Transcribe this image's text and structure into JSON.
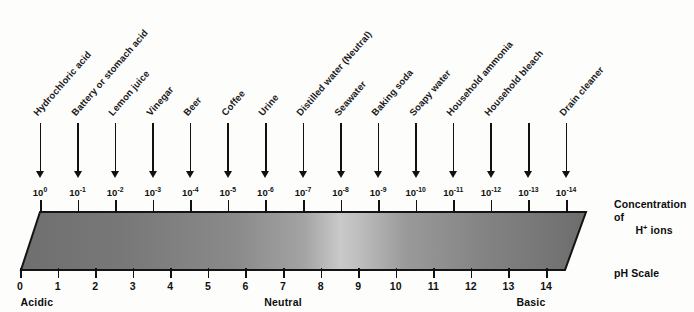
{
  "diagram": {
    "title": "pH Scale",
    "concentration_caption_line1": "Concentration of",
    "concentration_caption_line2_prefix": "H",
    "concentration_caption_line2_sup": "+",
    "concentration_caption_line2_suffix": " ions",
    "ph_scale_caption": "pH Scale"
  },
  "colors": {
    "ink": "#111111",
    "background": "#fdfdfc",
    "bar_dark": "#6e6e6e",
    "bar_light": "#c8c8c8",
    "bar_outline": "#111111"
  },
  "chart_data": {
    "type": "bar",
    "title": "pH Scale",
    "xlabel": "pH Scale",
    "ylabel": "Concentration of H+ ions",
    "grid": false,
    "legend": null,
    "axis_ph": {
      "label": "pH Scale",
      "range": [
        0,
        14
      ],
      "ticks": [
        0,
        1,
        2,
        3,
        4,
        5,
        6,
        7,
        8,
        9,
        10,
        11,
        12,
        13,
        14
      ],
      "tick_labels": [
        "0",
        "1",
        "2",
        "3",
        "4",
        "5",
        "6",
        "7",
        "8",
        "9",
        "10",
        "11",
        "12",
        "13",
        "14"
      ]
    },
    "axis_concentration": {
      "label": "Concentration of H+ ions",
      "tick_labels": [
        "10⁰",
        "10⁻¹",
        "10⁻²",
        "10⁻³",
        "10⁻⁴",
        "10⁻⁵",
        "10⁻⁶",
        "10⁻⁷",
        "10⁻⁸",
        "10⁻⁹",
        "10⁻¹⁰",
        "10⁻¹¹",
        "10⁻¹²",
        "10⁻¹³",
        "10⁻¹⁴"
      ]
    },
    "zones": [
      {
        "label": "Acidic",
        "ph": 0.45
      },
      {
        "label": "Neutral",
        "ph": 7.0
      },
      {
        "label": "Basic",
        "ph": 13.6
      }
    ],
    "categories": [
      0,
      1,
      2,
      3,
      4,
      5,
      6,
      7,
      8,
      9,
      10,
      11,
      12,
      13,
      14
    ],
    "values": [
      0,
      -1,
      -2,
      -3,
      -4,
      -5,
      -6,
      -7,
      -8,
      -9,
      -10,
      -11,
      -12,
      -13,
      -14
    ],
    "substances": [
      {
        "name": "Hydrochloric acid",
        "ph": 0,
        "exp_base": "10",
        "exp": "0"
      },
      {
        "name": "Battery or stomach acid",
        "ph": 1,
        "exp_base": "10",
        "exp": "-1"
      },
      {
        "name": "Lemon juice",
        "ph": 2,
        "exp_base": "10",
        "exp": "-2"
      },
      {
        "name": "Vinegar",
        "ph": 3,
        "exp_base": "10",
        "exp": "-3"
      },
      {
        "name": "Beer",
        "ph": 4,
        "exp_base": "10",
        "exp": "-4"
      },
      {
        "name": "Coffee",
        "ph": 5,
        "exp_base": "10",
        "exp": "-5"
      },
      {
        "name": "Urine",
        "ph": 6,
        "exp_base": "10",
        "exp": "-6"
      },
      {
        "name": "Distilled water (Neutral)",
        "ph": 7,
        "exp_base": "10",
        "exp": "-7"
      },
      {
        "name": "Seawater",
        "ph": 8,
        "exp_base": "10",
        "exp": "-8"
      },
      {
        "name": "Baking soda",
        "ph": 9,
        "exp_base": "10",
        "exp": "-9"
      },
      {
        "name": "Soapy water",
        "ph": 10,
        "exp_base": "10",
        "exp": "-10"
      },
      {
        "name": "Household ammonia",
        "ph": 11,
        "exp_base": "10",
        "exp": "-11"
      },
      {
        "name": "Household bleach",
        "ph": 12,
        "exp_base": "10",
        "exp": "-12"
      },
      {
        "name": "Drain cleaner",
        "ph": 14,
        "exp_base": "10",
        "exp": "-14"
      }
    ],
    "arrow_count": 15
  }
}
